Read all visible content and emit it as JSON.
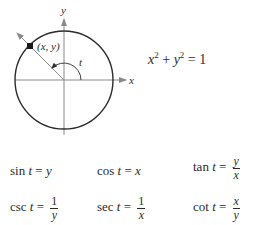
{
  "diagram": {
    "axis_labels": {
      "x": "x",
      "y": "y"
    },
    "point_label": "(x, y)",
    "angle_label": "t",
    "colors": {
      "circle": "#2b2b2b",
      "axes": "#8a8a8a",
      "point": "#1a1a1a"
    }
  },
  "circle_equation": {
    "x": "x",
    "y": "y",
    "exp": "2",
    "plus": " + ",
    "equals": " = 1"
  },
  "identities": [
    {
      "func": "sin",
      "var": "t",
      "equals": "=",
      "rhs": "y"
    },
    {
      "func": "cos",
      "var": "t",
      "equals": "=",
      "rhs": "x"
    },
    {
      "func": "tan",
      "var": "t",
      "equals": "=",
      "num": "y",
      "den": "x"
    },
    {
      "func": "csc",
      "var": "t",
      "equals": "=",
      "num": "1",
      "den": "y"
    },
    {
      "func": "sec",
      "var": "t",
      "equals": "=",
      "num": "1",
      "den": "x"
    },
    {
      "func": "cot",
      "var": "t",
      "equals": "=",
      "num": "x",
      "den": "y"
    }
  ]
}
